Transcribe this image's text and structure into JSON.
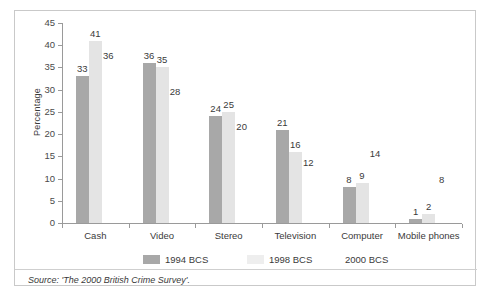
{
  "chart_data": {
    "type": "bar",
    "title": "",
    "xlabel": "",
    "ylabel": "Percentage",
    "ylim": [
      0,
      45
    ],
    "ytick_step": 5,
    "yticks": [
      45,
      40,
      35,
      30,
      25,
      20,
      15,
      10,
      5,
      0
    ],
    "grid": false,
    "legend_position": "bottom",
    "categories": [
      "Cash",
      "Video",
      "Stereo",
      "Television",
      "Computer",
      "Mobile phones"
    ],
    "series": [
      {
        "name": "1994 BCS",
        "color": "#a8a8a8",
        "values": [
          33,
          36,
          24,
          21,
          8,
          1
        ]
      },
      {
        "name": "1998 BCS",
        "color": "#e4e4e4",
        "values": [
          41,
          35,
          25,
          16,
          9,
          2
        ]
      },
      {
        "name": "2000 BCS",
        "color": "#ffffff",
        "values": [
          36,
          28,
          20,
          12,
          14,
          8
        ]
      }
    ]
  },
  "footer": {
    "source": "Source: 'The 2000 British Crime Survey'."
  }
}
